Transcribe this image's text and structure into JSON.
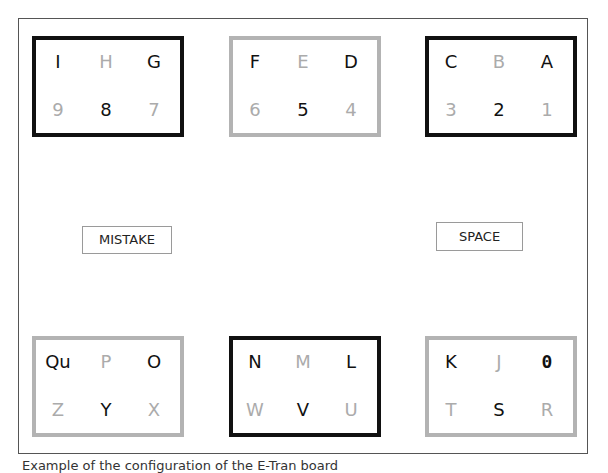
{
  "board": {
    "boxes": [
      {
        "id": "box-ihg",
        "border": "black",
        "cells": [
          {
            "label": "I",
            "dim": false
          },
          {
            "label": "H",
            "dim": true
          },
          {
            "label": "G",
            "dim": false
          },
          {
            "label": "9",
            "dim": true
          },
          {
            "label": "8",
            "dim": false
          },
          {
            "label": "7",
            "dim": true
          }
        ]
      },
      {
        "id": "box-fed",
        "border": "gray",
        "cells": [
          {
            "label": "F",
            "dim": false
          },
          {
            "label": "E",
            "dim": true
          },
          {
            "label": "D",
            "dim": false
          },
          {
            "label": "6",
            "dim": true
          },
          {
            "label": "5",
            "dim": false
          },
          {
            "label": "4",
            "dim": true
          }
        ]
      },
      {
        "id": "box-cba",
        "border": "black",
        "cells": [
          {
            "label": "C",
            "dim": false
          },
          {
            "label": "B",
            "dim": true
          },
          {
            "label": "A",
            "dim": false
          },
          {
            "label": "3",
            "dim": true
          },
          {
            "label": "2",
            "dim": false
          },
          {
            "label": "1",
            "dim": true
          }
        ]
      },
      {
        "id": "box-qupo",
        "border": "gray",
        "cells": [
          {
            "label": "Qu",
            "dim": false
          },
          {
            "label": "P",
            "dim": true
          },
          {
            "label": "O",
            "dim": false
          },
          {
            "label": "Z",
            "dim": true
          },
          {
            "label": "Y",
            "dim": false
          },
          {
            "label": "X",
            "dim": true
          }
        ]
      },
      {
        "id": "box-nml",
        "border": "black",
        "cells": [
          {
            "label": "N",
            "dim": false
          },
          {
            "label": "M",
            "dim": true
          },
          {
            "label": "L",
            "dim": false
          },
          {
            "label": "W",
            "dim": true
          },
          {
            "label": "V",
            "dim": false
          },
          {
            "label": "U",
            "dim": true
          }
        ]
      },
      {
        "id": "box-kj0",
        "border": "gray",
        "cells": [
          {
            "label": "K",
            "dim": false
          },
          {
            "label": "J",
            "dim": true
          },
          {
            "label": "0",
            "dim": false
          },
          {
            "label": "T",
            "dim": true
          },
          {
            "label": "S",
            "dim": false
          },
          {
            "label": "R",
            "dim": true
          }
        ]
      }
    ],
    "buttons": {
      "mistake": "MISTAKE",
      "space": "SPACE"
    }
  },
  "caption": "Example of the configuration of the E-Tran board",
  "colors": {
    "dark": "#111111",
    "dim": "#ababab",
    "gray_border": "#b3b3b3"
  }
}
